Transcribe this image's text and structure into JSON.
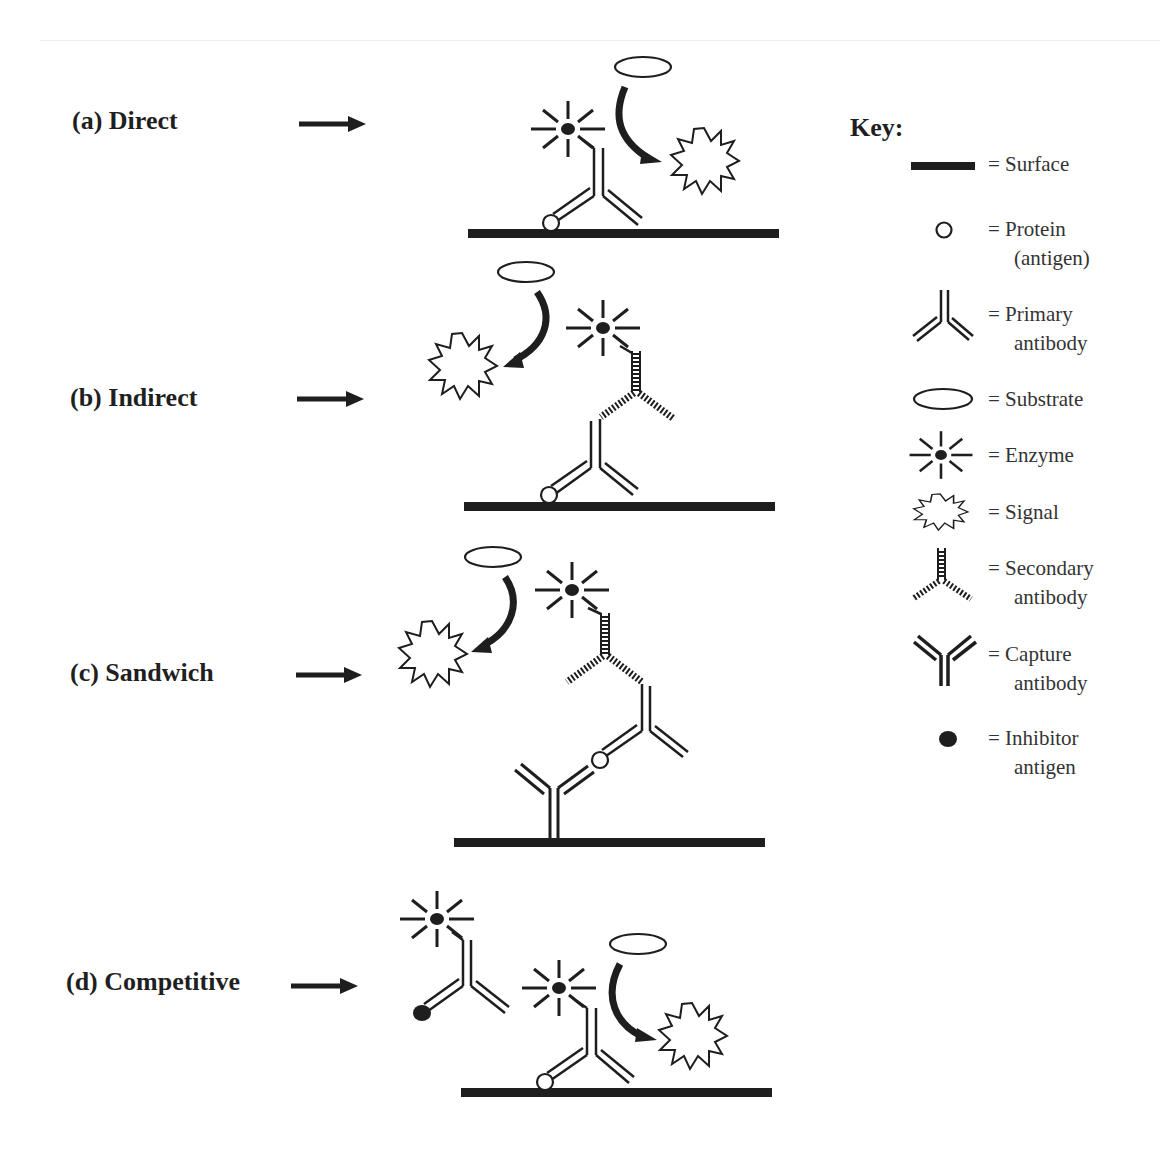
{
  "figure": {
    "colors": {
      "ink": "#1e1e1e",
      "background": "#ffffff"
    },
    "rows": [
      {
        "id": "a",
        "label": "(a) Direct",
        "components": [
          "surface",
          "protein-antigen",
          "primary-antibody",
          "enzyme",
          "substrate",
          "signal"
        ]
      },
      {
        "id": "b",
        "label": "(b) Indirect",
        "components": [
          "surface",
          "protein-antigen",
          "primary-antibody",
          "secondary-antibody",
          "enzyme",
          "substrate",
          "signal"
        ]
      },
      {
        "id": "c",
        "label": "(c) Sandwich",
        "components": [
          "surface",
          "capture-antibody",
          "protein-antigen",
          "primary-antibody",
          "secondary-antibody",
          "enzyme",
          "substrate",
          "signal"
        ]
      },
      {
        "id": "d",
        "label": "(d) Competitive",
        "components": [
          "surface",
          "protein-antigen",
          "primary-antibody",
          "inhibitor-antigen",
          "enzyme",
          "substrate",
          "signal"
        ]
      }
    ],
    "key": {
      "title": "Key:",
      "items": [
        {
          "symbol": "surface",
          "label": "= Surface"
        },
        {
          "symbol": "protein",
          "label": "= Protein",
          "label2": "(antigen)"
        },
        {
          "symbol": "primary-antibody",
          "label": "= Primary",
          "label2": "antibody"
        },
        {
          "symbol": "substrate",
          "label": "= Substrate"
        },
        {
          "symbol": "enzyme",
          "label": "= Enzyme"
        },
        {
          "symbol": "signal",
          "label": "= Signal"
        },
        {
          "symbol": "secondary-antibody",
          "label": "= Secondary",
          "label2": "antibody"
        },
        {
          "symbol": "capture-antibody",
          "label": "= Capture",
          "label2": "antibody"
        },
        {
          "symbol": "inhibitor-antigen",
          "label": "= Inhibitor",
          "label2": "antigen"
        }
      ]
    }
  }
}
